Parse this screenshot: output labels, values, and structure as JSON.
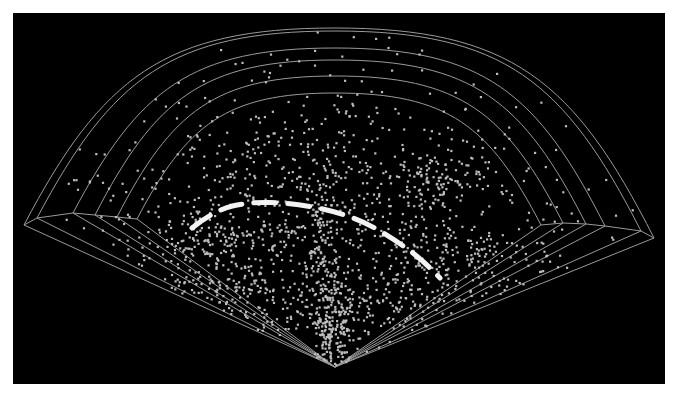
{
  "figure": {
    "background": "#000000",
    "frame_color": "#ffffff",
    "line_color": "#9a9a9a",
    "dot_color": "#bdbdbd",
    "highlight_color": "#f2f2f2"
  },
  "chart_data": {
    "type": "scatter",
    "title": "",
    "subtitle": "",
    "xlabel": "",
    "ylabel": "",
    "description": "Cone (wedge) diagram of point sources radiating from a vertex at the bottom center, with concentric arc shells and a dashed highlight arc tracing a ring-shaped structure.",
    "grid": true,
    "legend": null,
    "vertex": [
      335,
      367
    ],
    "shells": [
      {
        "top_y": 28,
        "left_end": [
          24,
          225
        ],
        "right_end": [
          654,
          238
        ]
      },
      {
        "top_y": 31,
        "left_end": [
          37,
          218
        ],
        "right_end": [
          641,
          231
        ]
      },
      {
        "top_y": 48,
        "left_end": [
          73,
          213
        ],
        "right_end": [
          605,
          226
        ]
      },
      {
        "top_y": 60,
        "left_end": [
          95,
          215
        ],
        "right_end": [
          586,
          224
        ]
      },
      {
        "top_y": 76,
        "left_end": [
          117,
          217
        ],
        "right_end": [
          563,
          223
        ]
      },
      {
        "top_y": 93,
        "left_end": [
          137,
          219
        ],
        "right_end": [
          541,
          225
        ]
      }
    ],
    "highlight_arc": {
      "style": "dashed",
      "points": [
        [
          192,
          228
        ],
        [
          215,
          210
        ],
        [
          250,
          202
        ],
        [
          290,
          203
        ],
        [
          330,
          210
        ],
        [
          365,
          222
        ],
        [
          395,
          240
        ],
        [
          420,
          258
        ],
        [
          440,
          278
        ]
      ]
    },
    "point_clusters": [
      {
        "center": [
          335,
          330
        ],
        "spread": [
          12,
          35
        ],
        "count": 220
      },
      {
        "center": [
          320,
          250
        ],
        "spread": [
          8,
          45
        ],
        "count": 120
      },
      {
        "center": [
          250,
          240
        ],
        "spread": [
          45,
          30
        ],
        "count": 160
      },
      {
        "center": [
          410,
          230
        ],
        "spread": [
          40,
          40
        ],
        "count": 150
      },
      {
        "center": [
          440,
          180
        ],
        "spread": [
          30,
          20
        ],
        "count": 90
      },
      {
        "center": [
          300,
          170
        ],
        "spread": [
          70,
          40
        ],
        "count": 160
      },
      {
        "center": [
          200,
          250
        ],
        "spread": [
          30,
          30
        ],
        "count": 90
      },
      {
        "center": [
          480,
          260
        ],
        "spread": [
          35,
          20
        ],
        "count": 80
      },
      {
        "center": [
          400,
          300
        ],
        "spread": [
          40,
          25
        ],
        "count": 90
      },
      {
        "center": [
          260,
          300
        ],
        "spread": [
          40,
          25
        ],
        "count": 90
      }
    ],
    "background_points": {
      "count": 520,
      "region": "within outer shell"
    },
    "seed": 1337
  }
}
